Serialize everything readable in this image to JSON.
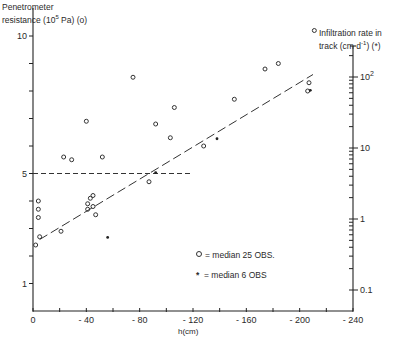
{
  "chart_data": {
    "type": "scatter",
    "title": "",
    "xlabel": "h(cm)",
    "ylabel_left": "Penetrometer resistance (10^5 Pa)(o)",
    "ylabel_right": "Infiltration rate in track (cm d-1)(*)",
    "x_ticks": [
      "0",
      "- 40",
      "- 80",
      "- 120",
      "- 160",
      "- 200",
      "- 240"
    ],
    "xlim": [
      0,
      -240
    ],
    "ylim_left": [
      0,
      10
    ],
    "y_ticks_left": [
      "1",
      "5",
      "10"
    ],
    "y_scale_right": "log",
    "ylim_right": [
      0.06,
      300
    ],
    "y_ticks_right": [
      "0.1",
      "1",
      "10",
      "10²"
    ],
    "grid": false,
    "series": [
      {
        "name": "median 25 OBS.",
        "marker": "circle",
        "axis": "left",
        "points": [
          [
            -2,
            2.4
          ],
          [
            -4,
            3.4
          ],
          [
            -4,
            3.7
          ],
          [
            -4,
            4.0
          ],
          [
            -5,
            2.7
          ],
          [
            -21,
            2.9
          ],
          [
            -23,
            5.6
          ],
          [
            -29,
            5.5
          ],
          [
            -40,
            6.9
          ],
          [
            -41,
            3.7
          ],
          [
            -41,
            3.9
          ],
          [
            -43,
            4.1
          ],
          [
            -45,
            4.2
          ],
          [
            -45,
            3.8
          ],
          [
            -47,
            3.5
          ],
          [
            -52,
            5.6
          ],
          [
            -75,
            8.5
          ],
          [
            -87,
            4.7
          ],
          [
            -92,
            6.8
          ],
          [
            -103,
            6.3
          ],
          [
            -106,
            7.4
          ],
          [
            -128,
            6.0
          ],
          [
            -151,
            7.7
          ],
          [
            -174,
            8.8
          ],
          [
            -184,
            9.0
          ],
          [
            -206,
            8.0
          ],
          [
            -207,
            8.3
          ],
          [
            -211,
            10.2
          ]
        ]
      },
      {
        "name": "median 6 OBS",
        "marker": "asterisk",
        "axis": "right",
        "points": [
          [
            -56,
            0.55
          ],
          [
            -92,
            4.5
          ],
          [
            -138,
            13.5
          ],
          [
            -208,
            65
          ]
        ]
      }
    ],
    "lines": [
      {
        "name": "regression",
        "style": "long-dash",
        "from": [
          -5,
          2.6
        ],
        "to": [
          -210,
          8.6
        ]
      },
      {
        "name": "threshold-5",
        "style": "dash",
        "from": [
          0,
          5
        ],
        "to": [
          -120,
          5
        ]
      }
    ],
    "legend": [
      {
        "marker": "o",
        "label": "= median  25 OBS."
      },
      {
        "marker": "*",
        "label": "= median  6 OBS"
      }
    ],
    "legend_position": "lower-center-right"
  },
  "labels": {
    "left_title_line1": "Penetrometer",
    "left_title_line2": "resistance (10",
    "left_title_sup": "5",
    "left_title_tail": " Pa) (o)",
    "right_title_line1": "Infiltration rate in",
    "right_title_line2": "track (cm  d",
    "right_title_sup": "-1",
    "right_title_tail": ") (*)",
    "x_title": "h(cm)",
    "legend_circle": "= median  25 OBS.",
    "legend_star": "= median  6 OBS"
  }
}
